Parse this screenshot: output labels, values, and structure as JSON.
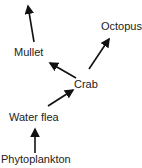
{
  "diagram": {
    "type": "food-chain",
    "nodes": [
      {
        "id": "mullet",
        "label": "Mullet"
      },
      {
        "id": "octopus",
        "label": "Octopus"
      },
      {
        "id": "crab",
        "label": "Crab"
      },
      {
        "id": "water_flea",
        "label": "Water flea"
      },
      {
        "id": "phytoplankton",
        "label": "Phytoplankton"
      }
    ],
    "edges": [
      {
        "from": "phytoplankton",
        "to": "water_flea"
      },
      {
        "from": "water_flea",
        "to": "crab"
      },
      {
        "from": "crab",
        "to": "mullet"
      },
      {
        "from": "crab",
        "to": "octopus"
      },
      {
        "from": "mullet",
        "to": "unlabeled-top"
      }
    ],
    "arrow_color": "#111111"
  }
}
